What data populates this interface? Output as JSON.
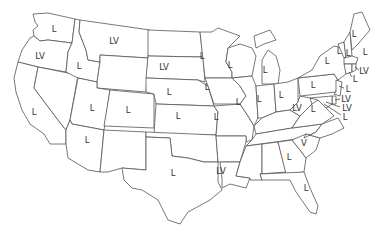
{
  "map": {
    "type": "us-states-choropleth-labels",
    "label_color": "#333333",
    "border_color": "#555555",
    "fill_color": "#ffffff",
    "states": [
      {
        "code": "WA",
        "label": "L"
      },
      {
        "code": "OR",
        "label": "LV"
      },
      {
        "code": "CA",
        "label": "L"
      },
      {
        "code": "ID",
        "label": "L"
      },
      {
        "code": "MT",
        "label": "LV"
      },
      {
        "code": "NV",
        "label": ""
      },
      {
        "code": "UT",
        "label": "L"
      },
      {
        "code": "AZ",
        "label": "L"
      },
      {
        "code": "WY",
        "label": ""
      },
      {
        "code": "CO",
        "label": "L"
      },
      {
        "code": "NM",
        "label": ""
      },
      {
        "code": "ND",
        "label": ""
      },
      {
        "code": "SD",
        "label": "LV"
      },
      {
        "code": "NE",
        "label": "L"
      },
      {
        "code": "KS",
        "label": "L"
      },
      {
        "code": "OK",
        "label": ""
      },
      {
        "code": "TX",
        "label": "L"
      },
      {
        "code": "MN",
        "label": "L"
      },
      {
        "code": "IA",
        "label": "L"
      },
      {
        "code": "MO",
        "label": "L"
      },
      {
        "code": "AR",
        "label": ""
      },
      {
        "code": "LA",
        "label": "LV"
      },
      {
        "code": "WI",
        "label": "L"
      },
      {
        "code": "IL",
        "label": "L"
      },
      {
        "code": "MI",
        "label": "L"
      },
      {
        "code": "IN",
        "label": "L"
      },
      {
        "code": "OH",
        "label": "L"
      },
      {
        "code": "KY",
        "label": ""
      },
      {
        "code": "TN",
        "label": ""
      },
      {
        "code": "MS",
        "label": ""
      },
      {
        "code": "AL",
        "label": ""
      },
      {
        "code": "GA",
        "label": "L"
      },
      {
        "code": "FL",
        "label": "L"
      },
      {
        "code": "SC",
        "label": "V"
      },
      {
        "code": "NC",
        "label": ""
      },
      {
        "code": "VA",
        "label": "L"
      },
      {
        "code": "WV",
        "label": "LV"
      },
      {
        "code": "PA",
        "label": "L"
      },
      {
        "code": "NY",
        "label": "L"
      },
      {
        "code": "VT",
        "label": "L"
      },
      {
        "code": "NH",
        "label": "L"
      },
      {
        "code": "ME",
        "label": "L"
      },
      {
        "code": "MA",
        "label": "L"
      },
      {
        "code": "RI",
        "label": "LV"
      },
      {
        "code": "CT",
        "label": "L"
      },
      {
        "code": "NJ",
        "label": "L"
      },
      {
        "code": "DE",
        "label": "LV"
      },
      {
        "code": "MD",
        "label": "LV"
      },
      {
        "code": "DC",
        "label": "L"
      }
    ]
  }
}
